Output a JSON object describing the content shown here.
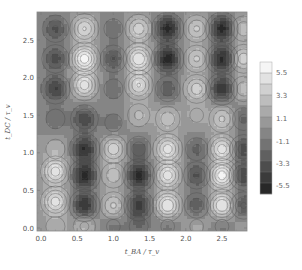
{
  "chart_data": {
    "type": "heatmap",
    "subtype": "contour",
    "title": "",
    "xlabel": "t_BA / τ_v",
    "ylabel": "t_DC / τ_v",
    "xlim": [
      0,
      2.8
    ],
    "ylim": [
      0,
      2.8
    ],
    "x_ticks": [
      "0.0",
      "0.5",
      "1.0",
      "1.5",
      "2.0",
      "2.5"
    ],
    "y_ticks": [
      "0.0",
      "0.5",
      "1.0",
      "1.5",
      "2.0",
      "2.5"
    ],
    "colorbar": {
      "labels": [
        "5.5",
        "3.3",
        "1.1",
        "-1.1",
        "-3.3",
        "-5.5"
      ],
      "range": [
        -6.6,
        6.6
      ],
      "levels": 12,
      "colormap": "grayscale (dark = negative, light = positive)"
    },
    "grid": false,
    "legend_position": "right",
    "extrema": [
      {
        "x": 0.2,
        "y": 2.65,
        "v": -3.5
      },
      {
        "x": 0.2,
        "y": 2.25,
        "v": -3.8
      },
      {
        "x": 0.2,
        "y": 1.85,
        "v": -4.5
      },
      {
        "x": 0.2,
        "y": 1.45,
        "v": -2.0
      },
      {
        "x": 0.2,
        "y": 1.05,
        "v": 2.0
      },
      {
        "x": 0.2,
        "y": 0.75,
        "v": 5.0
      },
      {
        "x": 0.2,
        "y": 0.35,
        "v": 5.0
      },
      {
        "x": 0.2,
        "y": 0.02,
        "v": 2.0
      },
      {
        "x": 0.6,
        "y": 2.65,
        "v": 4.5
      },
      {
        "x": 0.6,
        "y": 2.25,
        "v": 6.2
      },
      {
        "x": 0.6,
        "y": 1.9,
        "v": 5.0
      },
      {
        "x": 0.6,
        "y": 1.45,
        "v": -4.0
      },
      {
        "x": 0.6,
        "y": 1.05,
        "v": -5.5
      },
      {
        "x": 0.6,
        "y": 0.7,
        "v": -6.0
      },
      {
        "x": 0.6,
        "y": 0.3,
        "v": -5.5
      },
      {
        "x": 0.6,
        "y": 0.02,
        "v": 2.5
      },
      {
        "x": 1.0,
        "y": 2.65,
        "v": -2.0
      },
      {
        "x": 1.0,
        "y": 2.25,
        "v": -3.5
      },
      {
        "x": 1.0,
        "y": 1.85,
        "v": -2.0
      },
      {
        "x": 1.0,
        "y": 1.4,
        "v": -1.8
      },
      {
        "x": 1.0,
        "y": 1.05,
        "v": 4.0
      },
      {
        "x": 1.0,
        "y": 0.7,
        "v": 3.0
      },
      {
        "x": 1.0,
        "y": 0.3,
        "v": 3.5
      },
      {
        "x": 1.0,
        "y": 0.02,
        "v": -1.5
      },
      {
        "x": 1.35,
        "y": 2.65,
        "v": 4.0
      },
      {
        "x": 1.35,
        "y": 2.25,
        "v": 5.5
      },
      {
        "x": 1.35,
        "y": 1.9,
        "v": 4.5
      },
      {
        "x": 1.35,
        "y": 1.5,
        "v": 2.5
      },
      {
        "x": 1.35,
        "y": 1.05,
        "v": -3.0
      },
      {
        "x": 1.35,
        "y": 0.7,
        "v": -6.0
      },
      {
        "x": 1.35,
        "y": 0.3,
        "v": -5.0
      },
      {
        "x": 1.35,
        "y": 0.02,
        "v": -2.0
      },
      {
        "x": 1.75,
        "y": 2.65,
        "v": -6.0
      },
      {
        "x": 1.75,
        "y": 2.25,
        "v": -6.2
      },
      {
        "x": 1.75,
        "y": 1.85,
        "v": -3.0
      },
      {
        "x": 1.75,
        "y": 1.45,
        "v": 3.0
      },
      {
        "x": 1.75,
        "y": 1.05,
        "v": 5.0
      },
      {
        "x": 1.75,
        "y": 0.7,
        "v": 5.0
      },
      {
        "x": 1.75,
        "y": 0.3,
        "v": 5.5
      },
      {
        "x": 1.75,
        "y": 0.02,
        "v": -1.5
      },
      {
        "x": 2.15,
        "y": 2.65,
        "v": 3.5
      },
      {
        "x": 2.15,
        "y": 2.25,
        "v": 3.5
      },
      {
        "x": 2.15,
        "y": 1.85,
        "v": 4.0
      },
      {
        "x": 2.15,
        "y": 1.5,
        "v": 1.5
      },
      {
        "x": 2.15,
        "y": 1.05,
        "v": -2.5
      },
      {
        "x": 2.15,
        "y": 0.7,
        "v": -3.5
      },
      {
        "x": 2.15,
        "y": 0.3,
        "v": -3.0
      },
      {
        "x": 2.15,
        "y": 0.02,
        "v": 1.5
      },
      {
        "x": 2.5,
        "y": 2.65,
        "v": -6.2
      },
      {
        "x": 2.5,
        "y": 2.25,
        "v": -6.0
      },
      {
        "x": 2.5,
        "y": 1.85,
        "v": -5.5
      },
      {
        "x": 2.5,
        "y": 1.45,
        "v": 3.5
      },
      {
        "x": 2.5,
        "y": 1.05,
        "v": 5.0
      },
      {
        "x": 2.5,
        "y": 0.7,
        "v": 6.2
      },
      {
        "x": 2.5,
        "y": 0.3,
        "v": 5.5
      },
      {
        "x": 2.5,
        "y": 0.02,
        "v": -1.5
      },
      {
        "x": 2.8,
        "y": 2.65,
        "v": 3.0
      },
      {
        "x": 2.8,
        "y": 2.25,
        "v": 4.0
      },
      {
        "x": 2.8,
        "y": 1.85,
        "v": 3.0
      },
      {
        "x": 2.8,
        "y": 1.45,
        "v": -2.5
      },
      {
        "x": 2.8,
        "y": 1.05,
        "v": -4.0
      },
      {
        "x": 2.8,
        "y": 0.7,
        "v": -4.5
      },
      {
        "x": 2.8,
        "y": 0.3,
        "v": -3.5
      },
      {
        "x": 2.8,
        "y": 0.02,
        "v": 1.0
      }
    ]
  }
}
